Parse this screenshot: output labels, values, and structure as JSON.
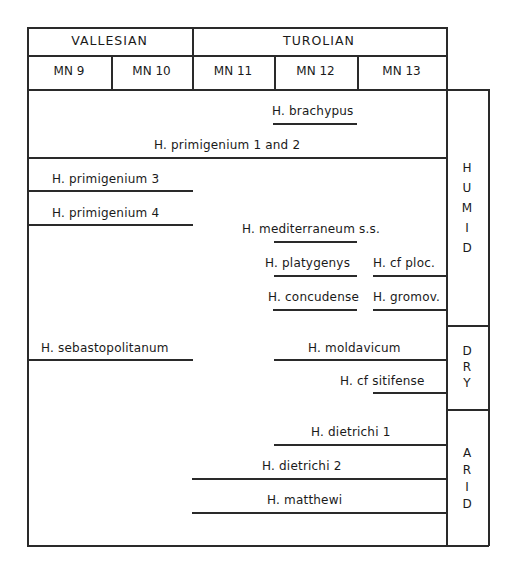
{
  "header": {
    "stages": [
      {
        "label": "VALLESIAN"
      },
      {
        "label": "TUROLIAN"
      }
    ],
    "zones": [
      {
        "label": "MN 9"
      },
      {
        "label": "MN 10"
      },
      {
        "label": "MN 11"
      },
      {
        "label": "MN 12"
      },
      {
        "label": "MN 13"
      }
    ]
  },
  "climate": {
    "humid": [
      "H",
      "U",
      "M",
      "I",
      "D"
    ],
    "dry": [
      "D",
      "R",
      "Y"
    ],
    "arid": [
      "A",
      "R",
      "I",
      "D"
    ]
  },
  "taxa": {
    "brachypus": "H. brachypus",
    "primigenium_1_2": "H. primigenium 1 and 2",
    "primigenium_3": "H. primigenium 3",
    "primigenium_4": "H. primigenium 4",
    "mediterraneum": "H. mediterraneum s.s.",
    "platygenys": "H. platygenys",
    "cf_ploc": "H. cf ploc.",
    "concudense": "H. concudense",
    "gromov": "H. gromov.",
    "sebastopolitanum": "H. sebastopolitanum",
    "moldavicum": "H. moldavicum",
    "cf_sitifense": "H. cf sitifense",
    "dietrichi_1": "H. dietrichi 1",
    "dietrichi_2": "H. dietrichi 2",
    "matthewi": "H. matthewi"
  }
}
